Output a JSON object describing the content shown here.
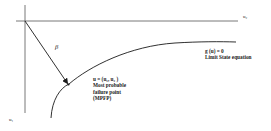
{
  "diagram": {
    "type": "reliability limit-state geometry",
    "axes": {
      "horizontal_label": "u₂",
      "vertical_label": "u₁"
    },
    "beta_label": "β",
    "limit_state": {
      "equation": "g (u) = 0",
      "caption": "Limit State equation"
    },
    "mpfp": {
      "point": "u = (u₁, u₂ )",
      "line1": "Most probable",
      "line2": "failure point",
      "line3": "(MPFP)"
    },
    "colors": {
      "line": "#333333",
      "text": "#1a1a1a",
      "background": "#ffffff"
    }
  }
}
